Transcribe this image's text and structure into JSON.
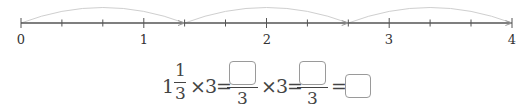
{
  "number_line": {
    "min": 0,
    "max": 4,
    "tick_step": "1/3",
    "labels": [
      "0",
      "1",
      "2",
      "3",
      "4"
    ],
    "jumps": [
      {
        "from": "0",
        "to": "4/3"
      },
      {
        "from": "4/3",
        "to": "8/3"
      },
      {
        "from": "8/3",
        "to": "4"
      }
    ],
    "colors": {
      "axis": "#555555",
      "arc": "#c8c8c8"
    }
  },
  "equation": {
    "whole": "1",
    "frac_num": "1",
    "frac_den": "3",
    "times": "×",
    "factor": "3",
    "equals": "=",
    "denominator_2": "3",
    "denominator_3": "3",
    "blanks": [
      "",
      "",
      ""
    ]
  }
}
